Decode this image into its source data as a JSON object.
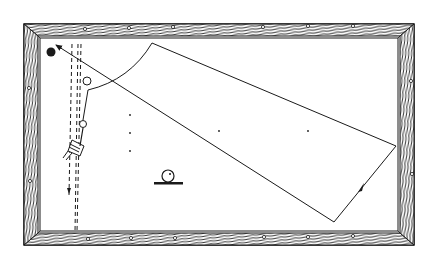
{
  "diagram": {
    "colors": {
      "ink": "#1a1a1a",
      "background": "#ffffff",
      "rail": "#ffffff"
    },
    "table": {
      "outer": {
        "x": 24,
        "y": 24,
        "w": 390,
        "h": 221
      },
      "inner": {
        "x": 38,
        "y": 38,
        "w": 362,
        "h": 195
      },
      "diamonds_top": [
        81,
        131,
        175,
        219,
        264,
        308,
        353
      ],
      "diamonds_bottom": [
        88,
        131,
        175,
        219,
        264,
        308,
        353
      ],
      "diamonds_left": [
        88,
        131,
        179
      ],
      "diamonds_right": [
        81,
        131,
        179
      ]
    },
    "balls": [
      {
        "name": "black-ball",
        "x": 51,
        "y": 52,
        "r": 4.5,
        "filled": true
      },
      {
        "name": "object-ball-upper",
        "x": 87,
        "y": 81,
        "r": 4,
        "filled": false
      },
      {
        "name": "object-ball-lower",
        "x": 83,
        "y": 124,
        "r": 3.5,
        "filled": false
      }
    ],
    "spots": [
      {
        "x": 130,
        "y": 115
      },
      {
        "x": 130,
        "y": 133
      },
      {
        "x": 130,
        "y": 151
      },
      {
        "x": 219,
        "y": 131
      },
      {
        "x": 308,
        "y": 131
      }
    ],
    "legend_icon": {
      "name": "ball-on-stand-icon",
      "x": 168,
      "y": 175,
      "r": 6
    }
  }
}
